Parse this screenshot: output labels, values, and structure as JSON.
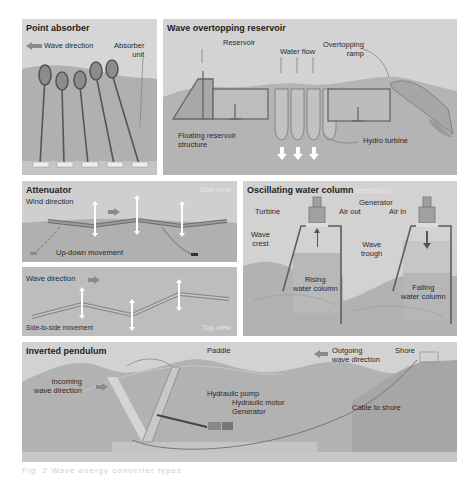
{
  "panels": {
    "point_absorber": {
      "title": "Point absorber",
      "wave_direction": "Wave direction",
      "absorber_unit": "Absorber\nunit"
    },
    "wave_overtopping": {
      "title": "Wave overtopping reservoir",
      "reservoir": "Reservoir",
      "water_flow": "Water flow",
      "overtopping_ramp": "Overtopping\nramp",
      "floating_structure": "Floating reservoir\nstructure",
      "hydro_turbine": "Hydro turbine"
    },
    "attenuator_side": {
      "title": "Attenuator",
      "view": "Side view",
      "wind_direction": "Wind direction",
      "movement": "Up-down movement"
    },
    "attenuator_top": {
      "wave_direction": "Wave direction",
      "view": "Top view",
      "movement": "Side-to-side movement"
    },
    "owc": {
      "title": "Oscillating water column",
      "subtitle": "(terminator)",
      "turbine": "Turbine",
      "air_out": "Air out",
      "generator": "Generator",
      "air_in": "Air in",
      "wave_crest": "Wave\ncrest",
      "wave_trough": "Wave\ntrough",
      "rising": "Rising\nwater column",
      "falling": "Falling\nwater column"
    },
    "inverted_pendulum": {
      "title": "Inverted pendulum",
      "paddle": "Paddle",
      "outgoing": "Outgoing\nwave direction",
      "shore": "Shore",
      "incoming": "Incoming\nwave direction",
      "hydraulic_pump": "Hydraulic pump",
      "hydraulic_motor": "Hydraulic motor",
      "generator": "Generator",
      "cable": "Cable to shore"
    }
  },
  "caption": "Fig. 2  Wave energy converter types",
  "colors": {
    "sky": "#d8d8d8",
    "water": "#b3b3b3",
    "water_dark": "#9e9e9e",
    "structure": "#6a6a6a",
    "arrow": "#8a8a8a"
  }
}
